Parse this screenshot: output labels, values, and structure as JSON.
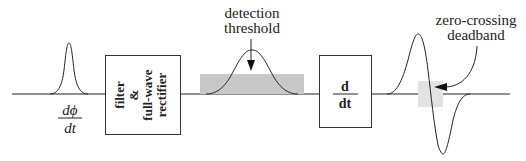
{
  "diagram": {
    "input_label": {
      "numerator": "dϕ",
      "denominator": "dt"
    },
    "blocks": [
      {
        "id": "filter-rectifier",
        "lines": [
          "filter",
          "&",
          "full-wave",
          "rectifier"
        ]
      },
      {
        "id": "differentiator",
        "numerator": "d",
        "denominator": "dt"
      }
    ],
    "annotations": {
      "threshold": [
        "detection",
        "threshold"
      ],
      "deadband": [
        "zero-crossing",
        "deadband"
      ]
    },
    "colors": {
      "line": "#222222",
      "threshold_fill": "#c8c8c8",
      "deadband_fill": "#e2e2e2",
      "box_stroke": "#333333"
    }
  }
}
